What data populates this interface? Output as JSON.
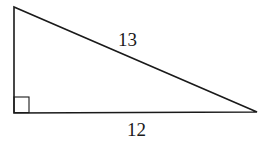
{
  "diagram": {
    "type": "right-triangle",
    "labels": {
      "hypotenuse": "13",
      "base": "12"
    },
    "right_angle_marker": true,
    "stroke_color": "#1a1a1a",
    "background": "#ffffff"
  }
}
